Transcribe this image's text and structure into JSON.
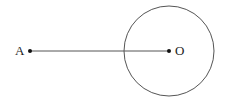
{
  "figure": {
    "background_color": "#ffffff",
    "stroke_color": "#555555",
    "point_color": "#111111",
    "label_color": "#1c1c1c",
    "canvas": {
      "width": 233,
      "height": 105
    },
    "circle": {
      "name": "circle-O",
      "center_x": 169,
      "center_y": 51,
      "radius": 45,
      "stroke_width": 1,
      "fill": "none"
    },
    "segment": {
      "name": "segment-AO",
      "x1": 30,
      "y1": 51,
      "x2": 169,
      "y2": 51,
      "stroke_width": 1
    },
    "points": [
      {
        "id": "A",
        "label": "A",
        "x": 30,
        "y": 51,
        "radius": 2,
        "label_position": "left"
      },
      {
        "id": "O",
        "label": "O",
        "x": 169,
        "y": 51,
        "radius": 2,
        "label_position": "right"
      }
    ]
  }
}
